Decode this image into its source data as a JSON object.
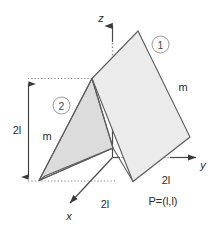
{
  "figure": {
    "background_color": "#ffffff"
  },
  "axes": {
    "z_label": "z",
    "y_label": "y",
    "x_label": "x",
    "origin_label": ""
  },
  "plates": [
    {
      "id": "plate-1",
      "callout": "1",
      "mass_label": "m",
      "fill_color": "#ebebeb",
      "stroke_color": "#5c5c5c"
    },
    {
      "id": "plate-2",
      "callout": "2",
      "mass_label": "m",
      "fill_color": "#dcdcdc",
      "stroke_color": "#5c5c5c"
    }
  ],
  "dimensions": {
    "height_label": "2l",
    "x_extent_label": "2l",
    "y_extent_label": "2l"
  },
  "points": {
    "p_label": "P=(l,l)"
  }
}
